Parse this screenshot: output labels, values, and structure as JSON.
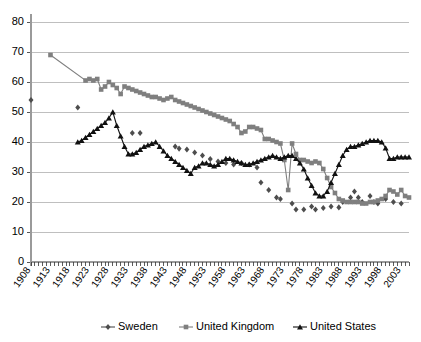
{
  "chart_data": {
    "type": "line",
    "title": "",
    "subtitle": "",
    "xlabel": "",
    "ylabel": "",
    "xlim": [
      1908,
      2005
    ],
    "ylim": [
      0,
      80
    ],
    "ytick_step": 10,
    "yticks": [
      "0",
      "10",
      "20",
      "30",
      "40",
      "50",
      "60",
      "70",
      "80"
    ],
    "xticks": [
      "1908",
      "1913",
      "1918",
      "1923",
      "1928",
      "1933",
      "1938",
      "1943",
      "1948",
      "1953",
      "1958",
      "1963",
      "1968",
      "1973",
      "1978",
      "1983",
      "1988",
      "1993",
      "1998",
      "2003"
    ],
    "xtick_step": 5,
    "grid": "horizontal",
    "legend_position": "bottom",
    "series": [
      {
        "name": "Sweden",
        "marker": "diamond",
        "color": "#4d4d4d",
        "line": false,
        "points": [
          [
            1908,
            54.0
          ],
          [
            1920,
            51.5
          ],
          [
            1934,
            43.0
          ],
          [
            1936,
            43.0
          ],
          [
            1945,
            38.5
          ],
          [
            1946,
            37.8
          ],
          [
            1948,
            37.5
          ],
          [
            1950,
            36.5
          ],
          [
            1952,
            35.5
          ],
          [
            1954,
            34.3
          ],
          [
            1956,
            33.5
          ],
          [
            1958,
            33.0
          ],
          [
            1960,
            32.5
          ],
          [
            1962,
            33.0
          ],
          [
            1964,
            32.5
          ],
          [
            1966,
            31.5
          ],
          [
            1967,
            26.5
          ],
          [
            1969,
            24.0
          ],
          [
            1971,
            21.5
          ],
          [
            1972,
            21.0
          ],
          [
            1975,
            19.5
          ],
          [
            1976,
            17.5
          ],
          [
            1978,
            17.5
          ],
          [
            1980,
            18.5
          ],
          [
            1981,
            17.5
          ],
          [
            1983,
            18.0
          ],
          [
            1985,
            18.5
          ],
          [
            1987,
            18.2
          ],
          [
            1988,
            20.0
          ],
          [
            1990,
            21.5
          ],
          [
            1991,
            23.5
          ],
          [
            1992,
            21.5
          ],
          [
            1993,
            20.0
          ],
          [
            1995,
            22.0
          ],
          [
            1996,
            20.0
          ],
          [
            1997,
            19.5
          ],
          [
            1999,
            21.0
          ],
          [
            2001,
            20.0
          ],
          [
            2003,
            19.5
          ]
        ]
      },
      {
        "name": "United Kingdom",
        "marker": "square",
        "color": "#7f7f7f",
        "line": true,
        "points": [
          [
            1913,
            69.0
          ],
          [
            1922,
            60.5
          ],
          [
            1923,
            61.0
          ],
          [
            1924,
            60.5
          ],
          [
            1925,
            61.0
          ],
          [
            1926,
            57.5
          ],
          [
            1927,
            58.5
          ],
          [
            1928,
            60.0
          ],
          [
            1929,
            59.0
          ],
          [
            1930,
            58.0
          ],
          [
            1931,
            56.0
          ],
          [
            1932,
            58.5
          ],
          [
            1933,
            58.0
          ],
          [
            1934,
            57.5
          ],
          [
            1935,
            57.0
          ],
          [
            1936,
            56.5
          ],
          [
            1937,
            56.0
          ],
          [
            1938,
            55.5
          ],
          [
            1939,
            55.0
          ],
          [
            1940,
            55.0
          ],
          [
            1941,
            54.5
          ],
          [
            1942,
            54.0
          ],
          [
            1943,
            54.5
          ],
          [
            1944,
            55.0
          ],
          [
            1945,
            54.0
          ],
          [
            1946,
            53.5
          ],
          [
            1947,
            53.0
          ],
          [
            1948,
            52.5
          ],
          [
            1949,
            52.0
          ],
          [
            1950,
            51.5
          ],
          [
            1951,
            51.0
          ],
          [
            1952,
            50.5
          ],
          [
            1953,
            50.0
          ],
          [
            1954,
            49.5
          ],
          [
            1955,
            49.0
          ],
          [
            1956,
            48.5
          ],
          [
            1957,
            48.0
          ],
          [
            1958,
            47.5
          ],
          [
            1959,
            47.0
          ],
          [
            1960,
            46.0
          ],
          [
            1961,
            45.0
          ],
          [
            1962,
            43.0
          ],
          [
            1963,
            43.5
          ],
          [
            1964,
            45.0
          ],
          [
            1965,
            45.0
          ],
          [
            1966,
            44.5
          ],
          [
            1967,
            44.0
          ],
          [
            1968,
            41.0
          ],
          [
            1969,
            41.0
          ],
          [
            1970,
            40.5
          ],
          [
            1971,
            40.0
          ],
          [
            1972,
            39.5
          ],
          [
            1973,
            34.0
          ],
          [
            1974,
            24.0
          ],
          [
            1975,
            39.5
          ],
          [
            1976,
            36.0
          ],
          [
            1977,
            34.0
          ],
          [
            1978,
            34.0
          ],
          [
            1979,
            33.5
          ],
          [
            1980,
            33.0
          ],
          [
            1981,
            33.5
          ],
          [
            1982,
            33.0
          ],
          [
            1983,
            31.0
          ],
          [
            1984,
            28.0
          ],
          [
            1985,
            25.0
          ],
          [
            1986,
            23.0
          ],
          [
            1987,
            21.0
          ],
          [
            1988,
            20.5
          ],
          [
            1989,
            20.0
          ],
          [
            1990,
            20.0
          ],
          [
            1991,
            20.0
          ],
          [
            1992,
            20.0
          ],
          [
            1993,
            19.5
          ],
          [
            1994,
            19.5
          ],
          [
            1995,
            20.0
          ],
          [
            1996,
            20.0
          ],
          [
            1997,
            20.5
          ],
          [
            1998,
            21.0
          ],
          [
            1999,
            22.0
          ],
          [
            2000,
            24.0
          ],
          [
            2001,
            23.5
          ],
          [
            2002,
            22.5
          ],
          [
            2003,
            24.0
          ],
          [
            2004,
            22.0
          ],
          [
            2005,
            21.5
          ]
        ]
      },
      {
        "name": "United States",
        "marker": "triangle",
        "color": "#111111",
        "line": true,
        "points": [
          [
            1920,
            40.0
          ],
          [
            1921,
            40.5
          ],
          [
            1922,
            41.5
          ],
          [
            1923,
            42.5
          ],
          [
            1924,
            43.5
          ],
          [
            1925,
            44.5
          ],
          [
            1926,
            45.5
          ],
          [
            1927,
            46.5
          ],
          [
            1928,
            48.0
          ],
          [
            1929,
            50.0
          ],
          [
            1930,
            45.5
          ],
          [
            1931,
            42.0
          ],
          [
            1932,
            38.5
          ],
          [
            1933,
            36.0
          ],
          [
            1934,
            36.0
          ],
          [
            1935,
            36.5
          ],
          [
            1936,
            37.5
          ],
          [
            1937,
            38.5
          ],
          [
            1938,
            39.0
          ],
          [
            1939,
            39.5
          ],
          [
            1940,
            40.0
          ],
          [
            1941,
            38.5
          ],
          [
            1942,
            37.0
          ],
          [
            1943,
            35.5
          ],
          [
            1944,
            34.5
          ],
          [
            1945,
            33.5
          ],
          [
            1946,
            32.5
          ],
          [
            1947,
            31.5
          ],
          [
            1948,
            30.5
          ],
          [
            1949,
            29.5
          ],
          [
            1950,
            31.5
          ],
          [
            1951,
            32.0
          ],
          [
            1952,
            33.0
          ],
          [
            1953,
            33.0
          ],
          [
            1954,
            32.5
          ],
          [
            1955,
            32.0
          ],
          [
            1956,
            32.5
          ],
          [
            1957,
            33.5
          ],
          [
            1958,
            34.5
          ],
          [
            1959,
            34.5
          ],
          [
            1960,
            34.0
          ],
          [
            1961,
            33.5
          ],
          [
            1962,
            33.0
          ],
          [
            1963,
            32.5
          ],
          [
            1964,
            32.5
          ],
          [
            1965,
            33.0
          ],
          [
            1966,
            33.5
          ],
          [
            1967,
            34.0
          ],
          [
            1968,
            34.5
          ],
          [
            1969,
            35.0
          ],
          [
            1970,
            35.5
          ],
          [
            1971,
            35.0
          ],
          [
            1972,
            34.5
          ],
          [
            1973,
            35.0
          ],
          [
            1974,
            35.5
          ],
          [
            1975,
            35.5
          ],
          [
            1976,
            34.5
          ],
          [
            1977,
            33.0
          ],
          [
            1978,
            31.0
          ],
          [
            1979,
            28.0
          ],
          [
            1980,
            25.5
          ],
          [
            1981,
            23.0
          ],
          [
            1982,
            22.0
          ],
          [
            1983,
            22.0
          ],
          [
            1984,
            23.5
          ],
          [
            1985,
            26.5
          ],
          [
            1986,
            29.5
          ],
          [
            1987,
            32.5
          ],
          [
            1988,
            35.5
          ],
          [
            1989,
            37.5
          ],
          [
            1990,
            38.5
          ],
          [
            1991,
            38.5
          ],
          [
            1992,
            39.0
          ],
          [
            1993,
            39.5
          ],
          [
            1994,
            40.0
          ],
          [
            1995,
            40.5
          ],
          [
            1996,
            40.5
          ],
          [
            1997,
            40.5
          ],
          [
            1998,
            40.0
          ],
          [
            1999,
            38.0
          ],
          [
            2000,
            34.5
          ],
          [
            2001,
            34.5
          ],
          [
            2002,
            35.0
          ],
          [
            2003,
            35.0
          ],
          [
            2004,
            35.0
          ],
          [
            2005,
            35.0
          ]
        ]
      }
    ]
  },
  "legend": {
    "items": [
      {
        "label": "Sweden",
        "marker": "diamond",
        "color": "#4d4d4d"
      },
      {
        "label": "United Kingdom",
        "marker": "square",
        "color": "#7f7f7f"
      },
      {
        "label": "United States",
        "marker": "triangle",
        "color": "#111111"
      }
    ]
  }
}
